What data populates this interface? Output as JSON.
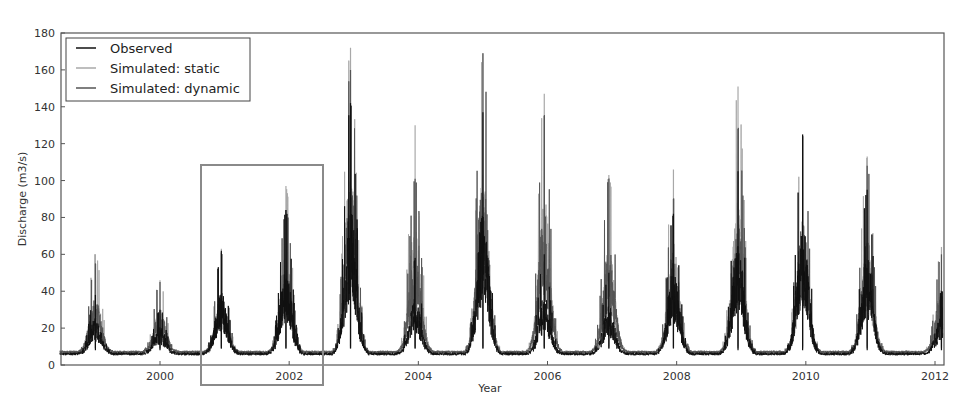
{
  "chart_data": {
    "type": "line",
    "title": "",
    "xlabel": "Year",
    "ylabel": "Discharge (m3/s)",
    "xlim": [
      1998.45,
      2012.15
    ],
    "ylim": [
      0,
      180
    ],
    "xticks": [
      2000,
      2002,
      2004,
      2006,
      2008,
      2010,
      2012
    ],
    "yticks": [
      0,
      20,
      40,
      60,
      80,
      100,
      120,
      140,
      160,
      180
    ],
    "grid": false,
    "legend_position": "upper left",
    "highlight_box": {
      "x0": 2000.63,
      "x1": 2002.52,
      "y_label": "window highlighted around 2001-2002"
    },
    "colors": {
      "observed": "#111111",
      "static": "#a8a8a8",
      "dynamic": "#555555",
      "box": "#8a8a8a"
    },
    "series": [
      {
        "name": "Observed",
        "seasonal_peaks": [
          {
            "year": 1999.0,
            "peak": 38,
            "base": 6
          },
          {
            "year": 2000.0,
            "peak": 30,
            "base": 6
          },
          {
            "year": 2000.95,
            "peak": 62,
            "base": 7
          },
          {
            "year": 2001.95,
            "peak": 84,
            "base": 7
          },
          {
            "year": 2002.95,
            "peak": 142,
            "base": 7
          },
          {
            "year": 2003.95,
            "peak": 58,
            "base": 7
          },
          {
            "year": 2005.0,
            "peak": 137,
            "base": 7
          },
          {
            "year": 2005.95,
            "peak": 60,
            "base": 7
          },
          {
            "year": 2006.95,
            "peak": 50,
            "base": 7
          },
          {
            "year": 2007.95,
            "peak": 82,
            "base": 7
          },
          {
            "year": 2008.95,
            "peak": 105,
            "base": 6
          },
          {
            "year": 2009.95,
            "peak": 125,
            "base": 6
          },
          {
            "year": 2010.95,
            "peak": 95,
            "base": 6
          },
          {
            "year": 2012.1,
            "peak": 40,
            "base": 6
          }
        ]
      },
      {
        "name": "Simulated: static",
        "seasonal_peaks": [
          {
            "year": 1999.0,
            "peak": 60,
            "base": 7
          },
          {
            "year": 2000.0,
            "peak": 46,
            "base": 7
          },
          {
            "year": 2000.95,
            "peak": 63,
            "base": 8
          },
          {
            "year": 2001.95,
            "peak": 97,
            "base": 8
          },
          {
            "year": 2002.95,
            "peak": 172,
            "base": 8
          },
          {
            "year": 2003.95,
            "peak": 130,
            "base": 8
          },
          {
            "year": 2005.0,
            "peak": 169,
            "base": 8
          },
          {
            "year": 2005.95,
            "peak": 147,
            "base": 8
          },
          {
            "year": 2006.95,
            "peak": 103,
            "base": 8
          },
          {
            "year": 2007.95,
            "peak": 106,
            "base": 8
          },
          {
            "year": 2008.95,
            "peak": 151,
            "base": 8
          },
          {
            "year": 2009.95,
            "peak": 125,
            "base": 8
          },
          {
            "year": 2010.95,
            "peak": 113,
            "base": 8
          },
          {
            "year": 2012.1,
            "peak": 64,
            "base": 8
          }
        ]
      },
      {
        "name": "Simulated: dynamic",
        "seasonal_peaks": [
          {
            "year": 1999.0,
            "peak": 55,
            "base": 7
          },
          {
            "year": 2000.0,
            "peak": 45,
            "base": 7
          },
          {
            "year": 2000.95,
            "peak": 61,
            "base": 7
          },
          {
            "year": 2001.95,
            "peak": 84,
            "base": 7
          },
          {
            "year": 2002.95,
            "peak": 160,
            "base": 7
          },
          {
            "year": 2003.95,
            "peak": 101,
            "base": 7
          },
          {
            "year": 2005.0,
            "peak": 169,
            "base": 7
          },
          {
            "year": 2005.95,
            "peak": 135,
            "base": 7
          },
          {
            "year": 2006.95,
            "peak": 101,
            "base": 7
          },
          {
            "year": 2007.95,
            "peak": 90,
            "base": 7
          },
          {
            "year": 2008.95,
            "peak": 128,
            "base": 7
          },
          {
            "year": 2009.95,
            "peak": 124,
            "base": 7
          },
          {
            "year": 2010.95,
            "peak": 108,
            "base": 7
          },
          {
            "year": 2012.1,
            "peak": 60,
            "base": 7
          }
        ]
      }
    ]
  },
  "legend": {
    "items": [
      {
        "label": "Observed",
        "color": "#111111"
      },
      {
        "label": "Simulated: static",
        "color": "#a8a8a8"
      },
      {
        "label": "Simulated: dynamic",
        "color": "#555555"
      }
    ]
  }
}
